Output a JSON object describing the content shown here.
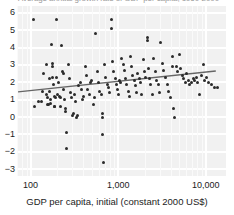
{
  "figure": {
    "title_clipped": "Average annual growth rate of GDP per capita, 1960-2000",
    "background_color": "#f1f1f1",
    "gridline_color": "#ffffff",
    "point_color": "#2b2b2b",
    "trend_color": "#666666"
  },
  "axes": {
    "x_label": "GDP per capita, initial (constant 2000 US$)",
    "x_ticks": [
      "100",
      "1,000",
      "10,000"
    ],
    "x_scale": "log",
    "y_ticks": [
      "6",
      "5",
      "4",
      "3",
      "2",
      "1",
      "0",
      "−1",
      "−2",
      "−3"
    ],
    "y_label": ""
  },
  "chart_data": {
    "type": "scatter",
    "title": "Average annual growth rate of GDP per capita, 1960-2000",
    "xlabel": "GDP per capita, initial (constant 2000 US$)",
    "ylabel": "",
    "xscale": "log",
    "xlim": [
      70,
      17000
    ],
    "ylim": [
      -3.4,
      6.4
    ],
    "xtick_values": [
      100,
      1000,
      10000
    ],
    "xtick_labels": [
      "100",
      "1,000",
      "10,000"
    ],
    "ytick_values": [
      6,
      5,
      4,
      3,
      2,
      1,
      0,
      -1,
      -2,
      -3
    ],
    "ytick_labels": [
      "6",
      "5",
      "4",
      "3",
      "2",
      "1",
      "0",
      "-1",
      "-2",
      "-3"
    ],
    "grid": true,
    "legend": "none",
    "series": [
      {
        "name": "Countries",
        "marker": "circle",
        "color": "#2b2b2b",
        "points": [
          [
            109,
            5.6
          ],
          [
            111,
            0.6
          ],
          [
            124,
            0.9
          ],
          [
            133,
            0.9
          ],
          [
            136,
            1.5
          ],
          [
            142,
            2.5
          ],
          [
            150,
            3.0
          ],
          [
            152,
            1.3
          ],
          [
            155,
            1.1
          ],
          [
            158,
            0.7
          ],
          [
            160,
            0.7
          ],
          [
            163,
            2.2
          ],
          [
            166,
            1.5
          ],
          [
            168,
            1.0
          ],
          [
            170,
            0.8
          ],
          [
            172,
            4.2
          ],
          [
            176,
            3.1
          ],
          [
            177,
            2.9
          ],
          [
            180,
            2.3
          ],
          [
            183,
            1.9
          ],
          [
            186,
            1.2
          ],
          [
            188,
            0.6
          ],
          [
            190,
            0.6
          ],
          [
            193,
            1.1
          ],
          [
            196,
            2.3
          ],
          [
            200,
            5.6
          ],
          [
            205,
            1.3
          ],
          [
            210,
            2.0
          ],
          [
            214,
            1.2
          ],
          [
            218,
            1.1
          ],
          [
            222,
            0.6
          ],
          [
            228,
            4.1
          ],
          [
            232,
            2.6
          ],
          [
            236,
            2.5
          ],
          [
            240,
            1.6
          ],
          [
            244,
            1.0
          ],
          [
            248,
            0.5
          ],
          [
            252,
            0.3
          ],
          [
            256,
            -0.9
          ],
          [
            260,
            -1.8
          ],
          [
            268,
            3.0
          ],
          [
            275,
            2.2
          ],
          [
            282,
            1.4
          ],
          [
            290,
            1.1
          ],
          [
            298,
            0.1
          ],
          [
            306,
            0.2
          ],
          [
            315,
            1.3
          ],
          [
            325,
            0.9
          ],
          [
            335,
            0.0
          ],
          [
            345,
            0.1
          ],
          [
            356,
            1.8
          ],
          [
            368,
            2.0
          ],
          [
            380,
            1.6
          ],
          [
            392,
            1.0
          ],
          [
            405,
            1.2
          ],
          [
            420,
            2.9
          ],
          [
            435,
            2.4
          ],
          [
            450,
            1.6
          ],
          [
            466,
            1.3
          ],
          [
            482,
            2.0
          ],
          [
            500,
            2.1
          ],
          [
            518,
            0.7
          ],
          [
            536,
            1.1
          ],
          [
            556,
            4.8
          ],
          [
            575,
            2.6
          ],
          [
            595,
            2.0
          ],
          [
            616,
            1.5
          ],
          [
            638,
            1.3
          ],
          [
            660,
            0.0
          ],
          [
            664,
            0.2
          ],
          [
            670,
            -1.0
          ],
          [
            676,
            -2.6
          ],
          [
            700,
            3.0
          ],
          [
            725,
            2.3
          ],
          [
            750,
            1.9
          ],
          [
            775,
            1.7
          ],
          [
            800,
            1.4
          ],
          [
            828,
            5.6
          ],
          [
            840,
            5.1
          ],
          [
            860,
            3.2
          ],
          [
            890,
            2.6
          ],
          [
            920,
            2.2
          ],
          [
            950,
            1.9
          ],
          [
            980,
            1.6
          ],
          [
            1000,
            1.3
          ],
          [
            1030,
            2.1
          ],
          [
            1060,
            2.0
          ],
          [
            1100,
            3.4
          ],
          [
            1140,
            3.0
          ],
          [
            1180,
            2.7
          ],
          [
            1220,
            2.2
          ],
          [
            1260,
            1.9
          ],
          [
            1300,
            1.5
          ],
          [
            1340,
            1.2
          ],
          [
            1380,
            3.5
          ],
          [
            1420,
            2.9
          ],
          [
            1470,
            2.4
          ],
          [
            1520,
            2.1
          ],
          [
            1570,
            1.8
          ],
          [
            1620,
            1.4
          ],
          [
            1680,
            2.5
          ],
          [
            1740,
            2.2
          ],
          [
            1800,
            2.0
          ],
          [
            1860,
            1.3
          ],
          [
            1920,
            3.3
          ],
          [
            1990,
            2.6
          ],
          [
            2060,
            2.3
          ],
          [
            2140,
            4.6
          ],
          [
            2160,
            4.4
          ],
          [
            2200,
            2.8
          ],
          [
            2280,
            2.2
          ],
          [
            2360,
            1.9
          ],
          [
            2450,
            1.3
          ],
          [
            2540,
            3.4
          ],
          [
            2640,
            2.6
          ],
          [
            2740,
            2.1
          ],
          [
            2850,
            1.9
          ],
          [
            2960,
            1.4
          ],
          [
            3080,
            4.3
          ],
          [
            3200,
            3.1
          ],
          [
            3330,
            2.7
          ],
          [
            3470,
            2.3
          ],
          [
            3620,
            1.9
          ],
          [
            3780,
            1.5
          ],
          [
            3950,
            1.1
          ],
          [
            4120,
            3.5
          ],
          [
            4200,
            2.9
          ],
          [
            4300,
            0.5
          ],
          [
            4450,
            0.0
          ],
          [
            4600,
            2.9
          ],
          [
            4800,
            2.6
          ],
          [
            5000,
            3.6
          ],
          [
            5200,
            2.8
          ],
          [
            5400,
            2.4
          ],
          [
            5600,
            2.2
          ],
          [
            5850,
            2.0
          ],
          [
            6100,
            2.5
          ],
          [
            6350,
            2.1
          ],
          [
            6600,
            1.9
          ],
          [
            6900,
            2.0
          ],
          [
            7200,
            2.2
          ],
          [
            7500,
            2.1
          ],
          [
            7800,
            2.3
          ],
          [
            8100,
            2.0
          ],
          [
            8500,
            1.3
          ],
          [
            8900,
            2.4
          ],
          [
            9300,
            3.0
          ],
          [
            9700,
            2.1
          ],
          [
            10200,
            2.3
          ],
          [
            10800,
            2.0
          ],
          [
            11500,
            1.9
          ],
          [
            12500,
            1.7
          ],
          [
            13500,
            1.7
          ]
        ]
      }
    ],
    "trendline": {
      "type": "linear-fit-on-log-x",
      "x_start": 72,
      "y_start": 1.45,
      "x_end": 13000,
      "y_end": 2.65,
      "color": "#666666"
    }
  }
}
